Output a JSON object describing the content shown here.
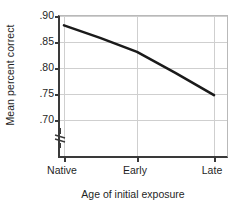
{
  "chart_data": {
    "type": "line",
    "title": "",
    "xlabel": "Age of initial exposure",
    "ylabel": "Mean percent correct",
    "categories": [
      "Native",
      "Early",
      "Late"
    ],
    "values": [
      0.882,
      0.831,
      0.748
    ],
    "series": [
      {
        "name": "Mean percent correct",
        "values": [
          0.882,
          0.831,
          0.748
        ]
      }
    ],
    "ylim": [
      0.7,
      0.9
    ],
    "yticks": [
      0.9,
      0.85,
      0.8,
      0.75,
      0.7
    ],
    "ytick_labels": [
      ".90",
      ".85",
      ".80",
      ".75",
      ".70"
    ],
    "grid": true,
    "legend": "none",
    "axis_break": true,
    "line_color": "#1a1a1a"
  },
  "axes": {
    "y_title": "Mean percent correct",
    "x_title": "Age of initial exposure",
    "y_labels": [
      ".90",
      ".85",
      ".80",
      ".75",
      ".70"
    ],
    "x_labels": [
      "Native",
      "Early",
      "Late"
    ]
  }
}
